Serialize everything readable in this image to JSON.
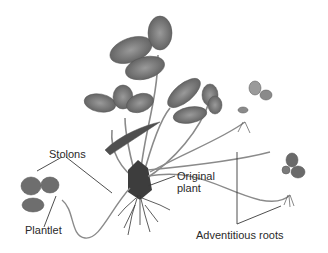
{
  "diagram": {
    "labels": {
      "stolons": "Stolons",
      "plantlet": "Plantlet",
      "original_plant_line1": "Original",
      "original_plant_line2": "plant",
      "adventitious_roots": "Adventitious roots"
    },
    "colors": {
      "leaf": "#7a7a7a",
      "leaf_dark": "#4f4f4f",
      "stem": "#8a8a8a",
      "root": "#333333",
      "line": "#3a3a3a",
      "text": "#2a2a2a"
    }
  }
}
